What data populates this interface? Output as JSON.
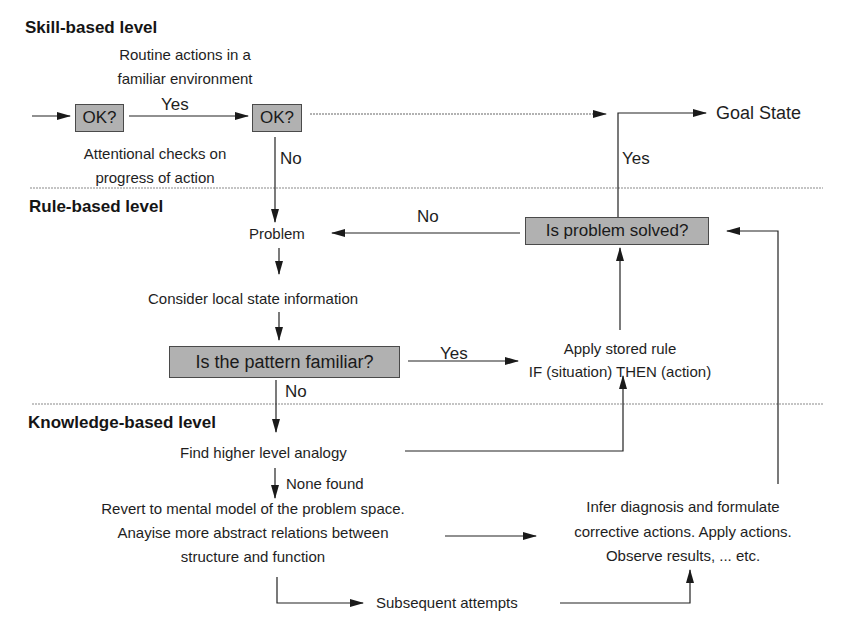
{
  "levels": {
    "skill": "Skill-based level",
    "rule": "Rule-based level",
    "knowledge": "Knowledge-based level"
  },
  "skill": {
    "routine_line1": "Routine actions in a",
    "routine_line2": "familiar environment",
    "ok1": "OK?",
    "ok2": "OK?",
    "yes_label": "Yes",
    "attention_line1": "Attentional checks on",
    "attention_line2": "progress of action",
    "no_label": "No",
    "goal_state": "Goal State",
    "goal_yes_label": "Yes"
  },
  "rule": {
    "problem": "Problem",
    "no_label": "No",
    "is_solved": "Is problem solved?",
    "consider": "Consider local state information",
    "pattern_familiar": "Is the pattern familiar?",
    "yes_label": "Yes",
    "apply_line1": "Apply stored rule",
    "apply_line2": "IF (situation) THEN (action)",
    "no_label2": "No"
  },
  "knowledge": {
    "find_analogy": "Find higher level analogy",
    "none_found": "None found",
    "revert_line1": "Revert to mental model of the problem space.",
    "revert_line2": "Anayise more abstract relations between",
    "revert_line3": "structure and function",
    "infer_line1": "Infer diagnosis and formulate",
    "infer_line2": "corrective actions. Apply actions.",
    "infer_line3": "Observe results, ... etc.",
    "subsequent": "Subsequent attempts"
  },
  "colors": {
    "box_fill": "#b9b9b9",
    "line": "#222222",
    "divider": "#8a8a8a"
  }
}
